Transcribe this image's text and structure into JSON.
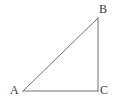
{
  "figure": {
    "kind": "right-triangle-diagram",
    "background_color": "#ffffff",
    "stroke_color": "#707070",
    "stroke_width": 1,
    "label_color": "#3d3d3d",
    "label_font_size": 12,
    "canvas": {
      "width": 115,
      "height": 107
    },
    "vertices": [
      {
        "id": "A",
        "label": "A",
        "x": 23,
        "y": 91,
        "angle_type": "acute",
        "label_x": 10,
        "label_y": 84
      },
      {
        "id": "B",
        "label": "B",
        "x": 98,
        "y": 18,
        "angle_type": "acute",
        "label_x": 99,
        "label_y": 3
      },
      {
        "id": "C",
        "label": "C",
        "x": 98,
        "y": 91,
        "angle_type": "right",
        "label_x": 100,
        "label_y": 84
      }
    ],
    "edges": [
      {
        "id": "AB",
        "name": "hypotenuse",
        "from": "A",
        "to": "B"
      },
      {
        "id": "BC",
        "name": "vertical-leg",
        "from": "B",
        "to": "C"
      },
      {
        "id": "CA",
        "name": "base-leg",
        "from": "C",
        "to": "A"
      }
    ],
    "polygon_points": "23,91 98,18 98,91"
  }
}
